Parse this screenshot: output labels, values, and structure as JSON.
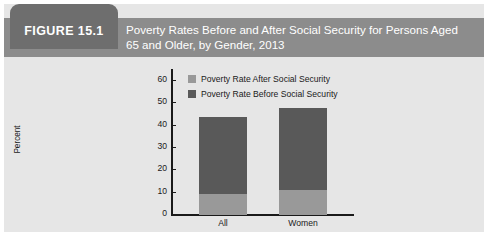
{
  "figure": {
    "tab_label": "FIGURE 15.1",
    "title": "Poverty Rates Before and After Social Security for Persons Aged 65 and Older, by Gender, 2013",
    "header_color": "#8c8c8c",
    "tab_color": "#6e6e6e",
    "body_color": "#e6e6e6"
  },
  "chart_data": {
    "type": "bar",
    "subtype": "stacked",
    "title": "Poverty Rates Before and After Social Security for Persons Aged 65 and Older, by Gender, 2013",
    "xlabel": "",
    "ylabel": "Percent",
    "categories": [
      "All",
      "Women"
    ],
    "ylim": [
      0,
      65
    ],
    "yticks": [
      0,
      10,
      20,
      30,
      40,
      50,
      60
    ],
    "ytick_labels": [
      "0",
      "10",
      "20",
      "30",
      "40",
      "50",
      "60"
    ],
    "grid": false,
    "legend_position": "top-center",
    "series": [
      {
        "name": "Poverty Rate After Social Security",
        "color": "#999999",
        "values": [
          9.5,
          11
        ]
      },
      {
        "name": "Poverty Rate Before Social Security",
        "color": "#595959",
        "values": [
          44,
          48
        ]
      }
    ],
    "legend": [
      {
        "label": "Poverty Rate After Social Security",
        "color": "#999999"
      },
      {
        "label": "Poverty Rate Before Social Security",
        "color": "#595959"
      }
    ]
  }
}
